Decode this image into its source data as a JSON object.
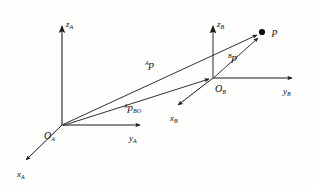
{
  "figure": {
    "type": "vector-diagram",
    "background_color": "#fdfdfb",
    "stroke_color": "#1a1a1a",
    "axis_color": "#555555"
  },
  "frame_a": {
    "origin_label": {
      "base": "O",
      "sub": "A"
    },
    "axes": [
      {
        "name": "z-axis",
        "base": "z",
        "sub": "A"
      },
      {
        "name": "y-axis",
        "base": "y",
        "sub": "A"
      },
      {
        "name": "x-axis",
        "base": "x",
        "sub": "A"
      }
    ]
  },
  "frame_b": {
    "origin_label": {
      "base": "O",
      "sub": "B"
    },
    "axes": [
      {
        "name": "z-axis",
        "base": "z",
        "sub": "B"
      },
      {
        "name": "y-axis",
        "base": "y",
        "sub": "B"
      },
      {
        "name": "x-axis",
        "base": "x",
        "sub": "B"
      }
    ]
  },
  "point": {
    "label": "p"
  },
  "vectors": [
    {
      "name": "p-in-frame-a",
      "sup": "A",
      "base": "p",
      "sub": "",
      "from": "O_A",
      "to": "p"
    },
    {
      "name": "origin-b-in-frame-a",
      "sup": "A",
      "base": "p",
      "sub": "BO",
      "from": "O_A",
      "to": "O_B"
    },
    {
      "name": "p-in-frame-b",
      "sup": "B",
      "base": "p",
      "sub": "",
      "from": "O_B",
      "to": "p"
    }
  ]
}
